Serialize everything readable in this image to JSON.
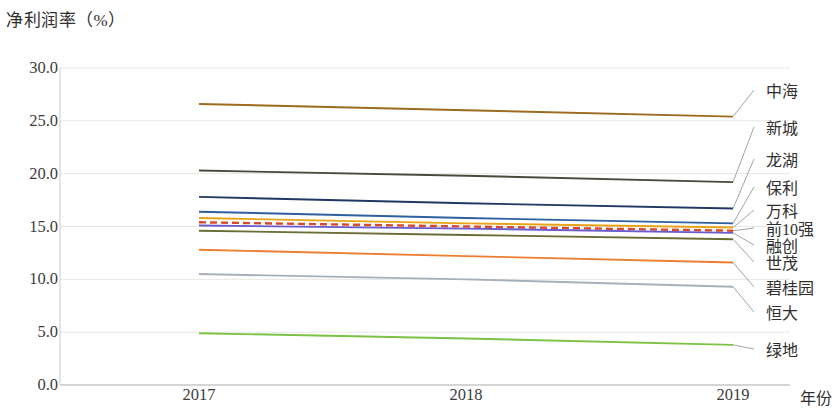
{
  "chart_data": {
    "type": "line",
    "title": "净利润率（%）",
    "xlabel": "年份",
    "ylabel": "",
    "categories": [
      "2017",
      "2018",
      "2019"
    ],
    "x": [
      2017,
      2018,
      2019
    ],
    "ylim": [
      0.0,
      30.0
    ],
    "yticks": [
      "0.0",
      "5.0",
      "10.0",
      "15.0",
      "20.0",
      "25.0",
      "30.0"
    ],
    "ytick_values": [
      0.0,
      5.0,
      10.0,
      15.0,
      20.0,
      25.0,
      30.0
    ],
    "grid": true,
    "legend_position": "right-callout",
    "series": [
      {
        "name": "中海",
        "values": [
          26.6,
          26.0,
          25.4
        ],
        "color": "#9c6b1e",
        "style": "solid"
      },
      {
        "name": "新城",
        "values": [
          20.3,
          19.8,
          19.2
        ],
        "color": "#4a4a3c",
        "style": "solid"
      },
      {
        "name": "龙湖",
        "values": [
          17.8,
          17.2,
          16.7
        ],
        "color": "#1f3864",
        "style": "solid"
      },
      {
        "name": "保利",
        "values": [
          16.4,
          15.8,
          15.3
        ],
        "color": "#2e5f9e",
        "style": "solid"
      },
      {
        "name": "万科",
        "values": [
          15.8,
          15.3,
          14.9
        ],
        "color": "#e8a317",
        "style": "solid"
      },
      {
        "name": "前10强",
        "values": [
          15.4,
          15.0,
          14.6
        ],
        "color": "#d94a2b",
        "style": "dashed"
      },
      {
        "name": "融创",
        "values": [
          15.1,
          14.8,
          14.4
        ],
        "color": "#6a5acd",
        "style": "solid"
      },
      {
        "name": "世茂",
        "values": [
          14.6,
          14.2,
          13.8
        ],
        "color": "#6b6b35",
        "style": "solid"
      },
      {
        "name": "碧桂园",
        "values": [
          12.8,
          12.2,
          11.6
        ],
        "color": "#ed7d31",
        "style": "solid"
      },
      {
        "name": "恒大",
        "values": [
          10.5,
          10.0,
          9.3
        ],
        "color": "#a6b0bb",
        "style": "solid"
      },
      {
        "name": "绿地",
        "values": [
          4.9,
          4.4,
          3.8
        ],
        "color": "#7cc243",
        "style": "solid"
      }
    ],
    "callouts": [
      {
        "name": "中海",
        "label_y": 90
      },
      {
        "name": "新城",
        "label_y": 127
      },
      {
        "name": "龙湖",
        "label_y": 159
      },
      {
        "name": "保利",
        "label_y": 187
      },
      {
        "name": "万科",
        "label_y": 210
      },
      {
        "name": "前10强",
        "label_y": 228
      },
      {
        "name": "融创",
        "label_y": 245
      },
      {
        "name": "世茂",
        "label_y": 262
      },
      {
        "name": "碧桂园",
        "label_y": 287
      },
      {
        "name": "恒大",
        "label_y": 312
      },
      {
        "name": "绿地",
        "label_y": 349
      }
    ]
  },
  "axis": {
    "x_labels": [
      {
        "text": "2017",
        "x": 199
      },
      {
        "text": "2018",
        "x": 466
      },
      {
        "text": "2019",
        "x": 733
      }
    ],
    "x_axis_title": "年份"
  }
}
